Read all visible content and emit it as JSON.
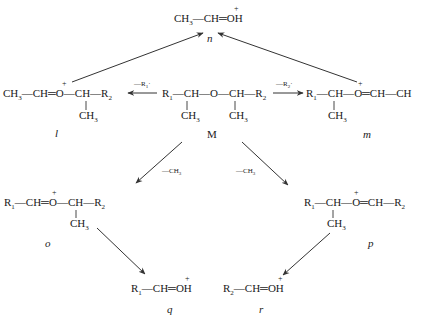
{
  "diagram": {
    "type": "fragmentation-scheme",
    "nodes": {
      "n": {
        "label": "n",
        "formula": "CH3—CH═OH+",
        "parts": {
          "a": "CH",
          "a_sub": "3",
          "b": "—CH═",
          "c": "OH",
          "charge": "+"
        }
      },
      "l": {
        "label": "l",
        "formula": "CH3—CH═O+—CH(CH3)—R2",
        "parts": {
          "a": "CH",
          "a_sub": "3",
          "b": "—CH═",
          "o": "O",
          "c": "—CH—R",
          "c_sub": "2",
          "branch": "CH",
          "branch_sub": "3",
          "charge": "+"
        }
      },
      "M": {
        "label": "M",
        "formula": "R1—CH(CH3)—O—CH(CH3)—R2",
        "parts": {
          "r1": "R",
          "r1_sub": "1",
          "b": "—CH—O—CH—R",
          "r2_sub": "2",
          "branch1": "CH",
          "branch1_sub": "3",
          "branch2": "CH",
          "branch2_sub": "3"
        }
      },
      "m": {
        "label": "m",
        "formula": "R1—CH(CH3)—O+═CH—CH",
        "parts": {
          "r1": "R",
          "r1_sub": "1",
          "b": "—CH—",
          "o": "O",
          "c": "═CH—CH",
          "branch": "CH",
          "branch_sub": "3",
          "charge": "+"
        }
      },
      "o": {
        "label": "o",
        "formula": "R1—CH═O+—CH(CH3)—R2",
        "parts": {
          "r1": "R",
          "r1_sub": "1",
          "b": "—CH═",
          "o": "O",
          "c": "—CH—R",
          "c_sub": "2",
          "branch": "CH",
          "branch_sub": "3",
          "charge": "+"
        }
      },
      "p": {
        "label": "p",
        "formula": "R1—CH(CH3)—O+═CH—R2",
        "parts": {
          "r1": "R",
          "r1_sub": "1",
          "b": "—CH—",
          "o": "O",
          "c": "═CH—R",
          "c_sub": "2",
          "branch": "CH",
          "branch_sub": "3",
          "charge": "+"
        }
      },
      "q": {
        "label": "q",
        "formula": "R1—CH═OH+",
        "parts": {
          "r1": "R",
          "r1_sub": "1",
          "b": "—CH═",
          "c": "OH",
          "charge": "+"
        }
      },
      "r": {
        "label": "r",
        "formula": "R2—CH═OH+",
        "parts": {
          "r1": "R",
          "r1_sub": "2",
          "b": "—CH═",
          "c": "OH",
          "charge": "+"
        }
      }
    },
    "edges": [
      {
        "from": "M",
        "to": "l",
        "label": "—R1·",
        "parts": {
          "t": "—R",
          "sub": "1",
          "dot": "·"
        }
      },
      {
        "from": "M",
        "to": "m",
        "label": "—R2·",
        "parts": {
          "t": "—R",
          "sub": "2",
          "dot": "·"
        }
      },
      {
        "from": "l",
        "to": "n",
        "label": ""
      },
      {
        "from": "m",
        "to": "n",
        "label": ""
      },
      {
        "from": "M",
        "to": "o",
        "label": "—CH3",
        "parts": {
          "t": "—CH",
          "sub": "3"
        }
      },
      {
        "from": "M",
        "to": "p",
        "label": "—CH3",
        "parts": {
          "t": "—CH",
          "sub": "3"
        }
      },
      {
        "from": "o",
        "to": "q",
        "label": ""
      },
      {
        "from": "p",
        "to": "r",
        "label": ""
      }
    ]
  }
}
